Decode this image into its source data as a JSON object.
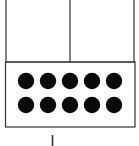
{
  "diagram": {
    "type": "ten-frame with place-value boxes",
    "top_boxes": 2,
    "dot_count": 10,
    "dot_rows": 2,
    "dots_per_row": 5,
    "colors": {
      "line": "#333333",
      "dot": "#0a0a0a",
      "background": "#ffffff"
    }
  }
}
